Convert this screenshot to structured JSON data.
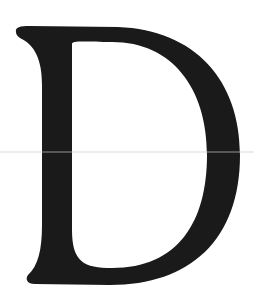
{
  "image": {
    "letter": "D",
    "color": "#1a1a1a",
    "background": "#ffffff"
  }
}
